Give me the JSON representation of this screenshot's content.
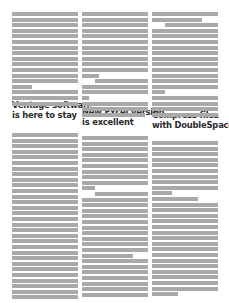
{
  "document": {
    "type": "newsletter-page-greeked",
    "columns": [
      {
        "id": "col1",
        "headline": [
          "Ventage software",
          "is here to stay"
        ],
        "top_block": {
          "start_y": 12,
          "lines": [
            1,
            1,
            1,
            1,
            1,
            1,
            1,
            1,
            1,
            1,
            1,
            1,
            1,
            0.3,
            1,
            1,
            1
          ]
        },
        "headline_y": 100,
        "bottom_block": {
          "start_y": 133,
          "lines": [
            1,
            1,
            1,
            1,
            1,
            1,
            1,
            1,
            1,
            1,
            1,
            1,
            1,
            1,
            1,
            1,
            1,
            1,
            1,
            1,
            1,
            1,
            1,
            1,
            1,
            1,
            1,
            1,
            1,
            1
          ]
        }
      },
      {
        "id": "col2",
        "headline": [
          "New Excel version",
          "is excellent"
        ],
        "top_block": {
          "start_y": 12,
          "lines": [
            1,
            1,
            1,
            1,
            1,
            1,
            1,
            1,
            1,
            1,
            1,
            0.25,
            "i0.8",
            1,
            1,
            0.1,
            1,
            1,
            0.95
          ]
        },
        "headline_y": 107,
        "bottom_block": {
          "start_y": 136,
          "lines": [
            1,
            1,
            1,
            1,
            1,
            1,
            1,
            1,
            1,
            0.2,
            "i0.8",
            1,
            1,
            1,
            1,
            1,
            1,
            1,
            1,
            1,
            1,
            0.78,
            1,
            1,
            1,
            1,
            1,
            1,
            1
          ]
        }
      },
      {
        "id": "col3",
        "headline": [
          "Compress files",
          "with DoubleSpace"
        ],
        "top_block": {
          "start_y": 12,
          "lines": [
            1,
            0.75,
            "i0.8",
            1,
            1,
            1,
            1,
            1,
            1,
            1,
            1,
            1,
            1,
            1,
            0.2,
            1,
            1,
            1,
            1
          ]
        },
        "headline_y": 110,
        "bottom_block": {
          "start_y": 141,
          "lines": [
            1,
            1,
            1,
            1,
            1,
            1,
            1,
            1,
            1,
            0.3,
            0.7,
            1,
            1,
            1,
            1,
            1,
            1,
            1,
            1,
            1,
            1,
            1,
            1,
            1,
            1,
            1,
            1,
            0.4
          ]
        }
      }
    ],
    "colors": {
      "text_greek": "#a9a9a9",
      "headline": "#2a2a2a",
      "background": "#ffffff"
    }
  }
}
